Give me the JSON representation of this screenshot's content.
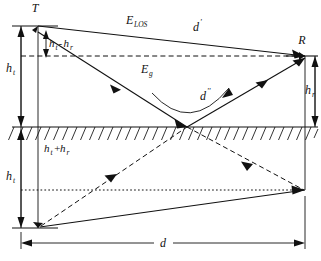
{
  "figure": {
    "type": "diagram",
    "background_color": "#ffffff",
    "line_color": "#111111",
    "width": 321,
    "height": 261
  },
  "nodes": {
    "transmitter": {
      "label": "T",
      "x": 38,
      "y": 26,
      "description": "transmitter antenna top"
    },
    "receiver": {
      "label": "R",
      "x": 305,
      "y": 56,
      "description": "receiver antenna top"
    },
    "reflection_point": {
      "x": 187,
      "y": 127,
      "description": "ground reflection point"
    },
    "image_transmitter": {
      "x": 38,
      "y": 228,
      "description": "mirror image of transmitter below ground"
    },
    "image_receiver": {
      "x": 305,
      "y": 190,
      "description": "mirror image of receiver below ground"
    }
  },
  "paths": {
    "line_of_sight": {
      "label": "E_LOS",
      "label_main": "E",
      "label_sub": "LOS",
      "label_x": 133,
      "label_y": 24,
      "style": "solid"
    },
    "los_distance": {
      "label": "d'",
      "label_main": "d",
      "label_prime": "'",
      "label_x": 196,
      "label_y": 31,
      "style": "solid"
    },
    "ground_reflected": {
      "label": "E_g",
      "label_main": "E",
      "label_sub": "g",
      "label_x": 145,
      "label_y": 73,
      "style": "solid"
    },
    "reflected_distance": {
      "label": "d''",
      "label_main": "d",
      "label_prime": "''",
      "label_x": 206,
      "label_y": 100,
      "style": "curved-arc"
    }
  },
  "dimensions": {
    "h_t_upper": {
      "label": "h_t",
      "label_main": "h",
      "label_sub": "t",
      "label_x": 10,
      "label_y": 72,
      "description": "transmitter height above ground"
    },
    "h_t_lower": {
      "label": "h_t",
      "label_main": "h",
      "label_sub": "t",
      "label_x": 10,
      "label_y": 180,
      "description": "mirrored transmitter height below ground"
    },
    "h_r": {
      "label": "h_r",
      "label_main": "h",
      "label_sub": "r",
      "label_x": 309,
      "label_y": 94,
      "description": "receiver height above ground"
    },
    "h_t_minus_h_r": {
      "label": "h_t-h_r",
      "label_main_1": "h",
      "label_sub_1": "t",
      "label_mid": "-",
      "label_main_2": "h",
      "label_sub_2": "r",
      "label_x": 38,
      "label_y": 47,
      "description": "height difference between transmitter and receiver"
    },
    "h_t_plus_h_r": {
      "label": "h_t+h_r",
      "label_main_1": "h",
      "label_sub_1": "t",
      "label_mid": "+",
      "label_main_2": "h",
      "label_sub_2": "r",
      "label_x": 44,
      "label_y": 152,
      "description": "sum of transmitter and receiver heights"
    },
    "d": {
      "label": "d",
      "label_main": "d",
      "label_x": 163,
      "label_y": 240,
      "description": "horizontal separation distance between T and R"
    }
  },
  "ground": {
    "y": 127,
    "x_start": 12,
    "x_end": 318,
    "hatch_count": 34,
    "description": "hatched ground plane / earth surface"
  }
}
